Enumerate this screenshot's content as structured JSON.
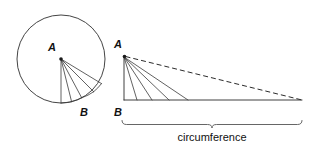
{
  "figure": {
    "background_color": "#ffffff",
    "line_color": "#2b2b2b",
    "width": 322,
    "height": 150
  },
  "circle_figure": {
    "name": "circle-diagram",
    "center_label": "A",
    "arc_point_label": "B",
    "center": {
      "x": 61,
      "y": 59
    },
    "radius": 44,
    "center_label_pos": {
      "x": 56,
      "y": 51
    },
    "arc_label_pos": {
      "x": 84,
      "y": 116
    },
    "radii_count": 5,
    "radii_endpoints": [
      {
        "x": 61,
        "y": 103
      },
      {
        "x": 73,
        "y": 101.3
      },
      {
        "x": 84,
        "y": 96.3
      },
      {
        "x": 93.6,
        "y": 88.4
      },
      {
        "x": 100.6,
        "y": 78.1
      }
    ],
    "sector_angles_deg": [
      90,
      76,
      62,
      48,
      34
    ]
  },
  "triangle_figure": {
    "name": "triangle-diagram",
    "apex_label": "A",
    "base_origin_label": "B",
    "apex": {
      "x": 124,
      "y": 56
    },
    "base_left": {
      "x": 124,
      "y": 100
    },
    "base_right": {
      "x": 302,
      "y": 100
    },
    "apex_label_pos": {
      "x": 122,
      "y": 48
    },
    "base_label_pos": {
      "x": 122,
      "y": 116
    },
    "height": 44,
    "base_length": 178,
    "radii_count": 5,
    "base_tick_points": [
      124,
      137,
      152,
      169,
      188
    ],
    "hypotenuse_style": "dashed"
  },
  "brace": {
    "name": "circumference-brace",
    "label": "circumference",
    "left_x": 122,
    "right_x": 302,
    "y": 121,
    "label_pos": {
      "x": 212,
      "y": 141
    }
  }
}
